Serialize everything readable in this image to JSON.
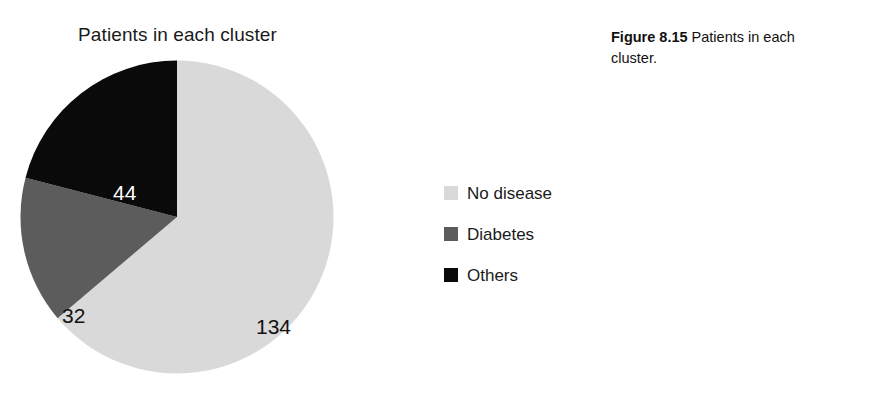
{
  "chart_data": {
    "type": "pie",
    "title": "Patients in each cluster",
    "xlabel": "",
    "ylabel": "",
    "total": 210,
    "start_angle_deg": 0,
    "direction": "clockwise",
    "grid": false,
    "legend_position": "right",
    "categories": [
      "No disease",
      "Diabetes",
      "Others"
    ],
    "values": [
      134,
      32,
      44
    ],
    "slices": [
      {
        "label": "No disease",
        "value": 134,
        "value_text": "134",
        "color": "#d9d9d9",
        "label_color": "#111111",
        "angle_deg": 229.7,
        "percent": 63.8
      },
      {
        "label": "Diabetes",
        "value": 32,
        "value_text": "32",
        "color": "#5c5c5c",
        "label_color": "#111111",
        "angle_deg": 54.9,
        "percent": 15.2
      },
      {
        "label": "Others",
        "value": 44,
        "value_text": "44",
        "color": "#0a0a0a",
        "label_color": "#ffffff",
        "angle_deg": 75.4,
        "percent": 21.0
      }
    ]
  },
  "chart": {
    "title": "Patients in each cluster"
  },
  "legend": {
    "items": [
      {
        "label": "No disease",
        "color": "#d9d9d9"
      },
      {
        "label": "Diabetes",
        "color": "#5c5c5c"
      },
      {
        "label": "Others",
        "color": "#0a0a0a"
      }
    ]
  },
  "caption": {
    "number": "Figure 8.15",
    "text": " Patients in each cluster."
  }
}
